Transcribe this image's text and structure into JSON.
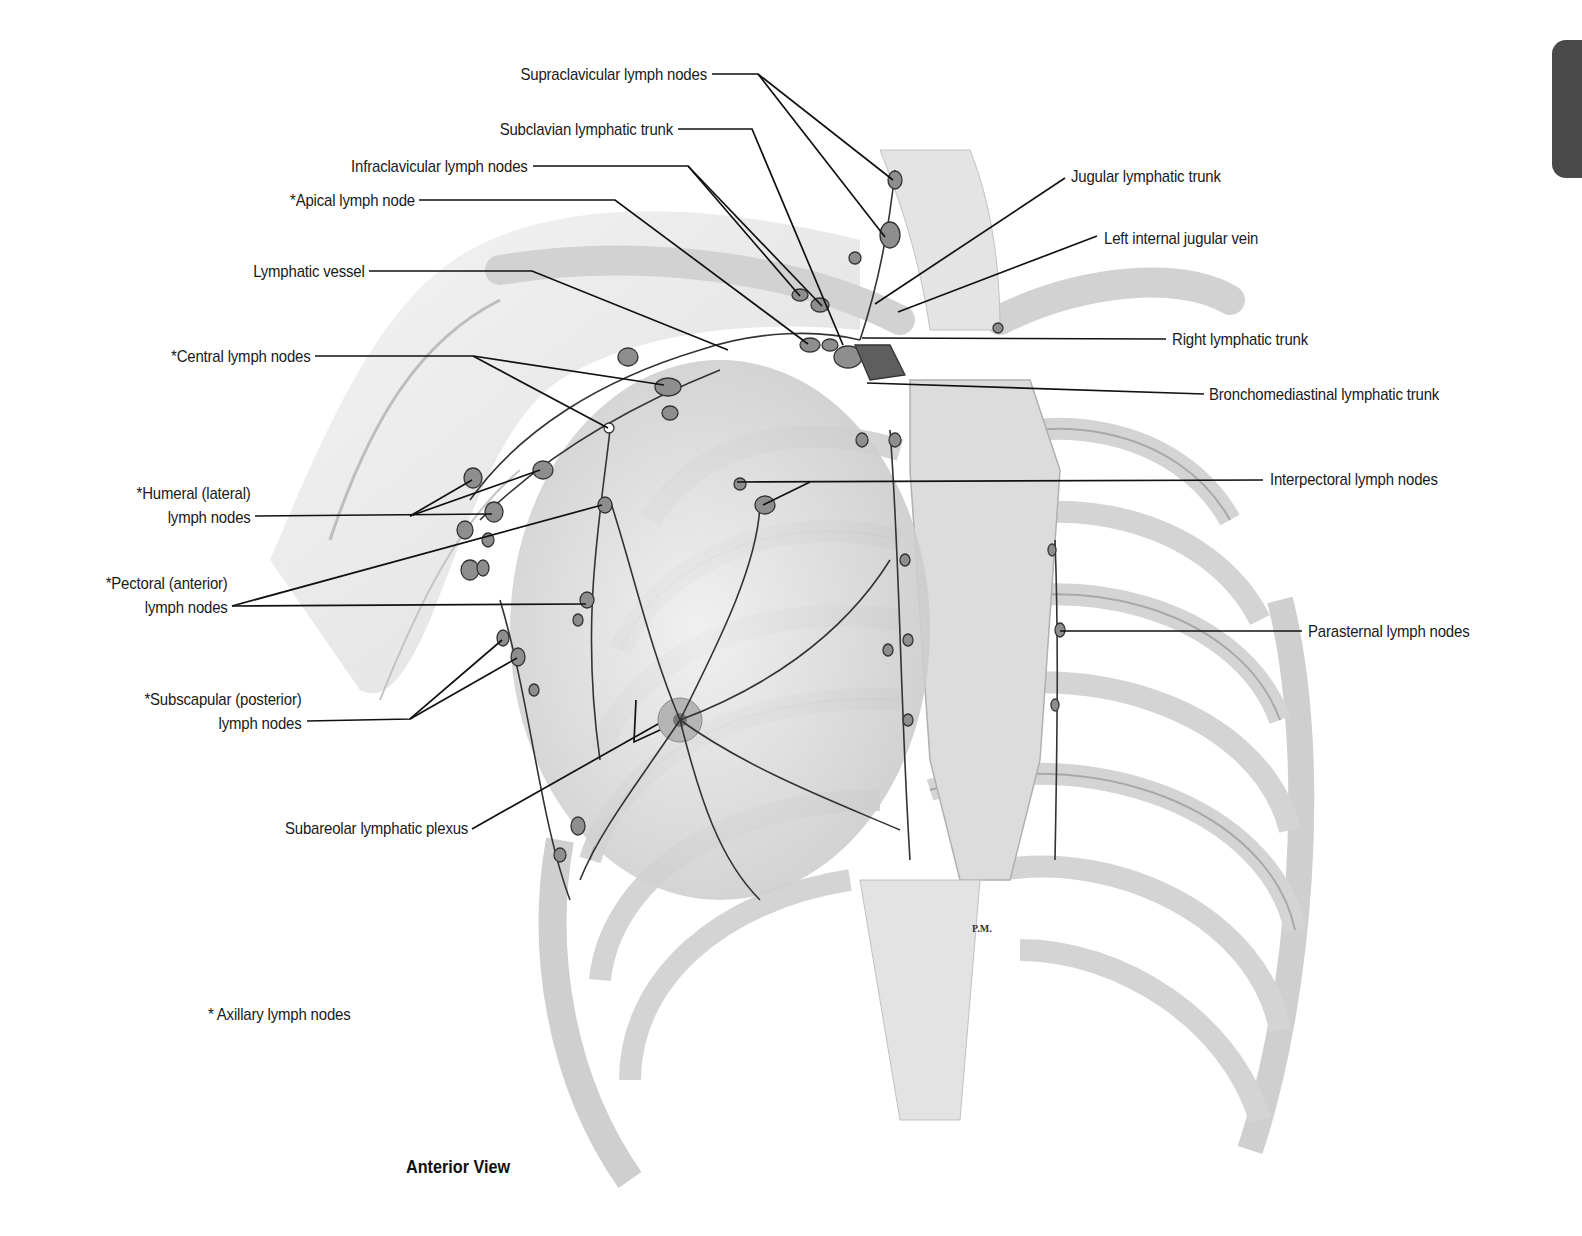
{
  "figure": {
    "view_caption": "Anterior View",
    "footnote": "* Axillary lymph nodes",
    "signature": "P.M."
  },
  "labels": {
    "supraclavicular": "Supraclavicular lymph nodes",
    "subclavian_trunk": "Subclavian lymphatic trunk",
    "infraclavicular": "Infraclavicular lymph nodes",
    "apical": "*Apical lymph node",
    "lymphatic_vessel": "Lymphatic vessel",
    "central": "*Central lymph nodes",
    "humeral": "*Humeral (lateral)\nlymph nodes",
    "pectoral": "*Pectoral (anterior)\nlymph nodes",
    "subscapular": "*Subscapular (posterior)\nlymph nodes",
    "subareolar": "Subareolar lymphatic plexus",
    "jugular_trunk": "Jugular lymphatic trunk",
    "left_ijv": "Left internal jugular vein",
    "right_trunk": "Right lymphatic trunk",
    "bronchomediastinal": "Bronchomediastinal lymphatic trunk",
    "interpectoral": "Interpectoral lymph nodes",
    "parasternal": "Parasternal lymph nodes"
  },
  "colors": {
    "line": "#111111",
    "tissue_light": "#e6e6e6",
    "tissue_mid": "#c8c8c8",
    "tissue_dark": "#9a9a9a",
    "node": "#8a8a8a",
    "tab": "#4a4a4a"
  }
}
